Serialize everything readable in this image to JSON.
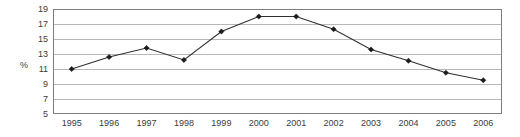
{
  "chart_data": {
    "type": "line",
    "title": "",
    "xlabel": "",
    "ylabel": "%",
    "categories": [
      "1995",
      "1996",
      "1997",
      "1998",
      "1999",
      "2000",
      "2001",
      "2002",
      "2003",
      "2004",
      "2005",
      "2006"
    ],
    "values": [
      11.0,
      12.6,
      13.8,
      12.2,
      16.0,
      18.0,
      18.0,
      16.3,
      13.6,
      12.1,
      10.5,
      9.5
    ],
    "ylim": [
      5,
      19
    ],
    "ytick_labels": [
      "19",
      "17",
      "15",
      "13",
      "11",
      "9",
      "7",
      "5"
    ],
    "ytick_values": [
      19,
      17,
      15,
      13,
      11,
      9,
      7,
      5
    ],
    "grid": true,
    "legend": "none",
    "series_name": "%",
    "marker": "diamond",
    "colors": {
      "line": "#303030",
      "marker": "#1a1a1a",
      "grid": "#b8b8b8",
      "frame": "#7d7d7d",
      "text": "#3b3b3b",
      "background": "#ffffff"
    }
  }
}
